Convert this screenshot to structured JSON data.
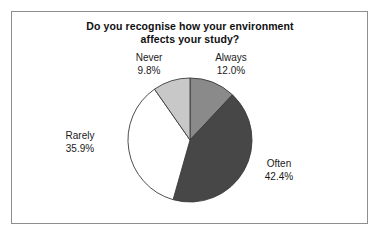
{
  "figure": {
    "frame_color": "#8e8e8e",
    "background": "#ffffff"
  },
  "chart_data": {
    "type": "pie",
    "title": "Do you recognise how your environment affects your study?",
    "title_line1": "Do you recognise how your environment",
    "title_line2": "affects your study?",
    "xlabel": "",
    "ylabel": "",
    "legend": "none",
    "grid": false,
    "start_angle_deg": 0,
    "direction": "clockwise",
    "categories": [
      "Always",
      "Often",
      "Rarely",
      "Never"
    ],
    "values": [
      12.0,
      42.4,
      35.9,
      9.8
    ],
    "value_unit": "%",
    "colors": [
      "#8a8a8a",
      "#474747",
      "#ffffff",
      "#c8c8c8"
    ],
    "slice_border_color": "#3a3a3a",
    "slices": [
      {
        "name": "Always",
        "label": "Always",
        "value": 12.0,
        "value_label": "12.0%",
        "color": "#8a8a8a",
        "start_deg": 0,
        "end_deg": 43.2
      },
      {
        "name": "Often",
        "label": "Often",
        "value": 42.4,
        "value_label": "42.4%",
        "color": "#474747",
        "start_deg": 43.2,
        "end_deg": 195.84
      },
      {
        "name": "Rarely",
        "label": "Rarely",
        "value": 35.9,
        "value_label": "35.9%",
        "color": "#ffffff",
        "start_deg": 195.84,
        "end_deg": 325.08
      },
      {
        "name": "Never",
        "label": "Never",
        "value": 9.8,
        "value_label": "9.8%",
        "color": "#c8c8c8",
        "start_deg": 325.08,
        "end_deg": 360
      }
    ],
    "geometry": {
      "center_x": 190,
      "center_y": 140,
      "radius": 62
    }
  }
}
